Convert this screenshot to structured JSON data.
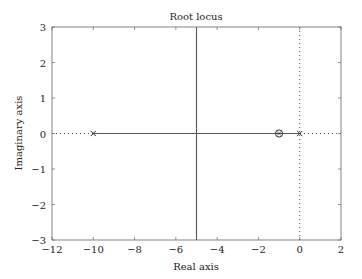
{
  "chart_data": {
    "type": "line",
    "title": "Root locus",
    "xlabel": "Real axis",
    "ylabel": "Imaginary axis",
    "xlim": [
      -12,
      2
    ],
    "ylim": [
      -3,
      3
    ],
    "xticks": [
      -12,
      -10,
      -8,
      -6,
      -4,
      -2,
      0,
      2
    ],
    "yticks": [
      -3,
      -2,
      -1,
      0,
      1,
      2,
      3
    ],
    "xtick_labels": [
      "−12",
      "−10",
      "−8",
      "−6",
      "−4",
      "−2",
      "0",
      "2"
    ],
    "ytick_labels": [
      "−3",
      "−2",
      "−1",
      "0",
      "1",
      "2",
      "3"
    ],
    "grid": false,
    "poles": [
      [
        -10,
        0
      ],
      [
        0,
        0
      ]
    ],
    "zeros": [
      [
        -1,
        0
      ]
    ],
    "series": [
      {
        "name": "locus-real-branch",
        "style": "solid",
        "x": [
          -10,
          0
        ],
        "y": [
          0,
          0
        ]
      },
      {
        "name": "asymptote",
        "style": "solid",
        "x": [
          -5,
          -5
        ],
        "y": [
          -3,
          3
        ]
      },
      {
        "name": "imag-axis",
        "style": "dotted",
        "x": [
          0,
          0
        ],
        "y": [
          -3,
          3
        ]
      },
      {
        "name": "real-axis",
        "style": "dotted",
        "x": [
          -12,
          2
        ],
        "y": [
          0,
          0
        ]
      }
    ],
    "colors": {
      "line": "#555555",
      "axis": "#666666",
      "text": "#222222"
    }
  }
}
